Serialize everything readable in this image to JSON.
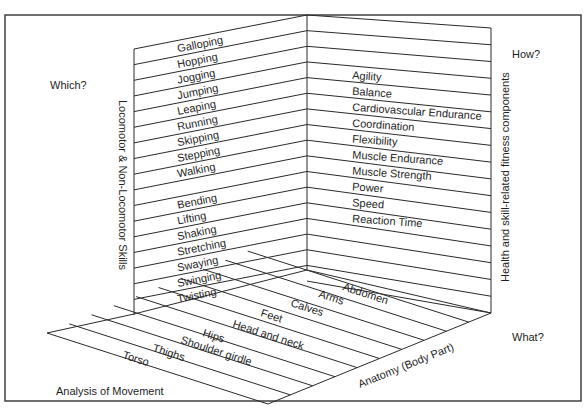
{
  "diagram": {
    "questions": {
      "which": "Which?",
      "how": "How?",
      "what": "What?"
    },
    "axis_titles": {
      "left_wall": "Locomotor & Non-Locomotor Skills",
      "right_wall": "Health and skill-related fitness components",
      "floor_right": "Anatomy (Body Part)",
      "floor_caption": "Analysis of Movement"
    },
    "skills": {
      "locomotor": [
        "Galloping",
        "Hopping",
        "Jogging",
        "Jumping",
        "Leaping",
        "Running",
        "Skipping",
        "Stepping",
        "Walking"
      ],
      "non_locomotor": [
        "Bending",
        "Lifting",
        "Shaking",
        "Stretching",
        "Swaying",
        "Swinging",
        "Twisting"
      ]
    },
    "fitness_components": [
      "Agility",
      "Balance",
      "Cardiovascular Endurance",
      "Coordination",
      "Flexibility",
      "Muscle Endurance",
      "Muscle Strength",
      "Power",
      "Speed",
      "Reaction Time"
    ],
    "body_parts": [
      "Abdomen",
      "Arms",
      "Calves",
      "Feet",
      "Head and neck",
      "Hips",
      "Shoulder girdle",
      "Thighs",
      "Torso"
    ]
  }
}
